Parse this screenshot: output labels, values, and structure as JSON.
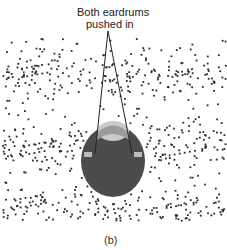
{
  "figure": {
    "annotation_line1": "Both eardrums",
    "annotation_line2": "pushed in",
    "caption": "(b)",
    "colors": {
      "background": "#ffffff",
      "dots": "#2a2a2a",
      "head": "#4a4a4a",
      "pointer_lines": "#222222"
    },
    "elements": [
      "air-molecule-dots with compression bands",
      "head viewed from above",
      "pointer lines to both ears"
    ],
    "compression_bands_y": [
      75,
      145,
      210
    ]
  }
}
